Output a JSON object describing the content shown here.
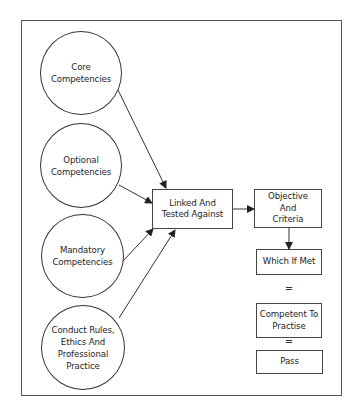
{
  "diagram": {
    "inputs": [
      {
        "id": "core",
        "label": "Core\nCompetencies"
      },
      {
        "id": "optional",
        "label": "Optional\nCompetencies"
      },
      {
        "id": "mandatory",
        "label": "Mandatory\nCompetencies"
      },
      {
        "id": "conduct",
        "label": "Conduct Rules,\nEthics And\nProfessional\nPractice"
      }
    ],
    "center": {
      "label": "Linked And\nTested Against"
    },
    "chain": [
      {
        "id": "objective",
        "label": "Objective\nAnd\nCriteria"
      },
      {
        "id": "which_if_met",
        "label": "Which If Met"
      },
      {
        "id": "competent",
        "label": "Competent To\nPractise"
      },
      {
        "id": "pass",
        "label": "Pass"
      }
    ],
    "connectors": {
      "equals_1": "=",
      "equals_2": "="
    },
    "edges": [
      {
        "from": "core",
        "to": "center"
      },
      {
        "from": "optional",
        "to": "center"
      },
      {
        "from": "mandatory",
        "to": "center"
      },
      {
        "from": "conduct",
        "to": "center"
      },
      {
        "from": "center",
        "to": "objective"
      },
      {
        "from": "objective",
        "to": "which_if_met"
      }
    ],
    "colors": {
      "line": "#333333",
      "background": "#ffffff"
    }
  }
}
